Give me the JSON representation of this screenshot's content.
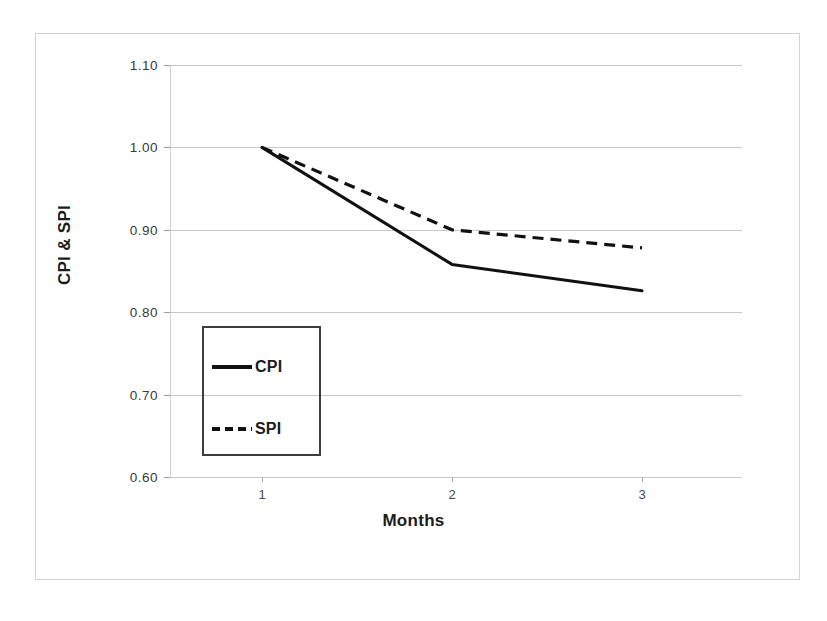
{
  "chart_data": {
    "type": "line",
    "title": "",
    "xlabel": "Months",
    "ylabel": "CPI & SPI",
    "x": [
      1,
      2,
      3
    ],
    "categories": [
      "1",
      "2",
      "3"
    ],
    "series": [
      {
        "name": "CPI",
        "style": "solid",
        "values": [
          1.0,
          0.858,
          0.826
        ]
      },
      {
        "name": "SPI",
        "style": "dashed",
        "values": [
          1.0,
          0.9,
          0.878
        ]
      }
    ],
    "ylim": [
      0.6,
      1.1
    ],
    "xlim": [
      0.5,
      3.5
    ],
    "y_ticks": [
      "1.10",
      "1.00",
      "0.90",
      "0.80",
      "0.70",
      "0.60"
    ],
    "y_tick_values": [
      1.1,
      1.0,
      0.9,
      0.8,
      0.7,
      0.6
    ],
    "x_ticks": [
      "1",
      "2",
      "3"
    ],
    "grid": true,
    "legend_position": "lower-left-inside",
    "legend_entries": [
      "CPI",
      "SPI"
    ],
    "colors": {
      "series_line": "#111111",
      "gridline": "#c9c9c9",
      "axis_line": "#cfcfcf",
      "frame": "#d2d2d2",
      "legend_border": "#3d3d3d",
      "tick_label": "#3a3a3a",
      "axis_title": "#1c1c1c",
      "background": "#ffffff"
    }
  },
  "axes": {
    "y_title": "CPI & SPI",
    "x_title": "Months"
  },
  "legend": {
    "items": [
      {
        "label": "CPI",
        "swatch": "solid-line-swatch"
      },
      {
        "label": "SPI",
        "swatch": "dashed-line-swatch"
      }
    ]
  }
}
